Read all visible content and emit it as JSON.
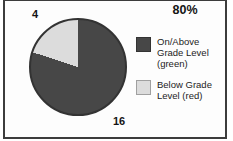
{
  "chart_data": {
    "type": "pie",
    "title_label": "80%",
    "slices": [
      {
        "name": "On/Above Grade Level (green)",
        "value": 16,
        "color": "#474747",
        "border": "#333333"
      },
      {
        "name": "Below Grade Level (red)",
        "value": 4,
        "color": "#dcdcdc",
        "border": "#a0a0a0"
      }
    ],
    "start_angle_deg": 0,
    "direction": "clockwise",
    "legend_position": "right",
    "outline_color": "#333333",
    "frame_color": "#3c3c3c"
  }
}
